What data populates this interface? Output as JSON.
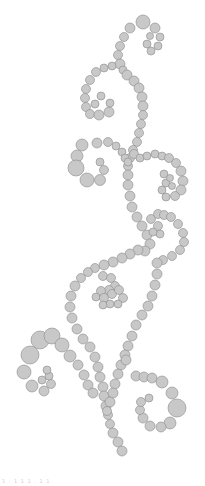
{
  "design": {
    "name": "rhinestone-swirl-pattern",
    "fill": "#c8c8c8",
    "stroke": "#8a8a8a",
    "background": "#ffffff"
  },
  "caption": "1 : 1   1 1 . 1 1",
  "circles": [
    [
      143,
      22,
      7
    ],
    [
      130,
      28,
      5
    ],
    [
      124,
      37,
      4.5
    ],
    [
      120,
      46,
      4.5
    ],
    [
      118,
      55,
      4.5
    ],
    [
      120,
      64,
      5
    ],
    [
      123,
      70,
      4
    ],
    [
      155,
      28,
      5
    ],
    [
      160,
      37,
      4
    ],
    [
      158,
      46,
      4
    ],
    [
      151,
      51,
      4
    ],
    [
      147,
      44,
      4
    ],
    [
      150,
      36,
      3.5
    ],
    [
      112,
      66,
      4
    ],
    [
      104,
      68,
      4
    ],
    [
      96,
      72,
      4.5
    ],
    [
      90,
      80,
      4.5
    ],
    [
      86,
      89,
      4.5
    ],
    [
      85,
      98,
      4.5
    ],
    [
      86,
      107,
      4.5
    ],
    [
      90,
      114,
      4.5
    ],
    [
      99,
      115,
      5
    ],
    [
      109,
      112,
      5
    ],
    [
      110,
      103,
      4
    ],
    [
      101,
      96,
      4
    ],
    [
      95,
      104,
      4
    ],
    [
      127,
      75,
      5
    ],
    [
      134,
      81,
      5
    ],
    [
      139,
      88,
      5
    ],
    [
      142,
      97,
      5
    ],
    [
      143,
      106,
      5
    ],
    [
      143,
      115,
      4.5
    ],
    [
      141,
      124,
      4.5
    ],
    [
      139,
      133,
      4.5
    ],
    [
      137,
      142,
      4.5
    ],
    [
      133,
      150,
      4.5
    ],
    [
      130,
      158,
      4.5
    ],
    [
      128,
      166,
      4.5
    ],
    [
      128,
      175,
      5
    ],
    [
      128,
      185,
      5
    ],
    [
      130,
      196,
      5
    ],
    [
      132,
      207,
      5
    ],
    [
      137,
      217,
      5
    ],
    [
      142,
      226,
      5
    ],
    [
      147,
      235,
      5
    ],
    [
      82,
      145,
      6
    ],
    [
      77,
      156,
      6
    ],
    [
      76,
      168,
      8
    ],
    [
      87,
      180,
      7
    ],
    [
      100,
      180,
      5.5
    ],
    [
      104,
      170,
      4.5
    ],
    [
      100,
      162,
      4
    ],
    [
      97,
      143,
      5
    ],
    [
      108,
      142,
      4.5
    ],
    [
      116,
      146,
      4
    ],
    [
      122,
      152,
      4
    ],
    [
      125,
      158,
      4
    ],
    [
      128,
      162,
      4
    ],
    [
      134,
      154,
      4.5
    ],
    [
      140,
      158,
      4
    ],
    [
      147,
      156,
      4
    ],
    [
      155,
      154,
      4
    ],
    [
      162,
      156,
      4
    ],
    [
      169,
      158,
      4.5
    ],
    [
      176,
      163,
      4.5
    ],
    [
      181,
      171,
      5
    ],
    [
      183,
      181,
      5
    ],
    [
      181,
      190,
      5
    ],
    [
      175,
      196,
      4.5
    ],
    [
      166,
      197,
      4
    ],
    [
      162,
      190,
      4
    ],
    [
      166,
      183,
      4
    ],
    [
      172,
      186,
      3.5
    ],
    [
      164,
      174,
      4
    ],
    [
      170,
      178,
      3.5
    ],
    [
      151,
      219,
      4.5
    ],
    [
      158,
      214,
      4.5
    ],
    [
      164,
      215,
      4.5
    ],
    [
      171,
      217,
      4.5
    ],
    [
      178,
      224,
      4.5
    ],
    [
      183,
      233,
      4.5
    ],
    [
      184,
      242,
      4.5
    ],
    [
      180,
      250,
      4.5
    ],
    [
      172,
      256,
      4.5
    ],
    [
      163,
      260,
      4.5
    ],
    [
      158,
      226,
      4.5
    ],
    [
      160,
      234,
      4
    ],
    [
      153,
      232,
      4
    ],
    [
      150,
      244,
      5
    ],
    [
      145,
      251,
      5
    ],
    [
      138,
      250,
      5
    ],
    [
      130,
      254,
      5
    ],
    [
      122,
      258,
      5
    ],
    [
      113,
      262,
      5
    ],
    [
      104,
      265,
      5
    ],
    [
      95,
      268,
      4.5
    ],
    [
      88,
      272,
      4.5
    ],
    [
      81,
      278,
      4.5
    ],
    [
      75,
      286,
      5
    ],
    [
      71,
      296,
      5
    ],
    [
      70,
      307,
      5
    ],
    [
      72,
      318,
      5
    ],
    [
      77,
      329,
      5
    ],
    [
      83,
      339,
      5
    ],
    [
      90,
      347,
      5
    ],
    [
      103,
      276,
      4.5
    ],
    [
      111,
      278,
      4.5
    ],
    [
      115,
      286,
      4.5
    ],
    [
      109,
      290,
      4.5
    ],
    [
      101,
      291,
      4.5
    ],
    [
      96,
      297,
      4
    ],
    [
      104,
      298,
      4.5
    ],
    [
      112,
      294,
      4.5
    ],
    [
      119,
      290,
      4.5
    ],
    [
      123,
      298,
      4.5
    ],
    [
      118,
      304,
      4
    ],
    [
      110,
      304,
      4
    ],
    [
      103,
      305,
      4
    ],
    [
      157,
      263,
      5
    ],
    [
      157,
      274,
      5
    ],
    [
      155,
      285,
      5
    ],
    [
      152,
      296,
      5
    ],
    [
      148,
      306,
      5
    ],
    [
      142,
      315,
      5
    ],
    [
      136,
      325,
      5
    ],
    [
      132,
      336,
      5
    ],
    [
      128,
      346,
      5
    ],
    [
      125,
      355,
      5
    ],
    [
      95,
      357,
      5
    ],
    [
      98,
      367,
      5
    ],
    [
      100,
      377,
      5
    ],
    [
      103,
      387,
      5
    ],
    [
      104,
      396,
      5
    ],
    [
      106,
      406,
      5
    ],
    [
      108,
      415,
      4.5
    ],
    [
      110,
      424,
      4.5
    ],
    [
      113,
      433,
      5
    ],
    [
      118,
      442,
      5
    ],
    [
      122,
      451,
      5
    ],
    [
      121,
      365,
      5
    ],
    [
      118,
      374,
      5
    ],
    [
      115,
      384,
      5
    ],
    [
      113,
      393,
      5
    ],
    [
      110,
      402,
      5
    ],
    [
      107,
      411,
      4.5
    ],
    [
      40,
      340,
      9
    ],
    [
      30,
      355,
      9
    ],
    [
      24,
      372,
      7
    ],
    [
      32,
      386,
      6
    ],
    [
      44,
      391,
      5
    ],
    [
      51,
      384,
      4.5
    ],
    [
      49,
      376,
      4
    ],
    [
      42,
      380,
      4
    ],
    [
      47,
      370,
      4
    ],
    [
      52,
      336,
      8
    ],
    [
      62,
      345,
      7
    ],
    [
      70,
      356,
      6
    ],
    [
      78,
      365,
      5
    ],
    [
      84,
      375,
      5
    ],
    [
      88,
      385,
      5
    ],
    [
      93,
      393,
      5
    ],
    [
      126,
      360,
      5
    ],
    [
      136,
      376,
      5
    ],
    [
      144,
      377,
      5
    ],
    [
      152,
      378,
      5
    ],
    [
      162,
      382,
      6
    ],
    [
      172,
      393,
      6
    ],
    [
      177,
      408,
      9
    ],
    [
      170,
      423,
      6
    ],
    [
      161,
      427,
      5
    ],
    [
      150,
      426,
      5
    ],
    [
      143,
      418,
      5
    ],
    [
      140,
      410,
      4.5
    ],
    [
      141,
      402,
      4.5
    ],
    [
      149,
      398,
      4
    ]
  ]
}
